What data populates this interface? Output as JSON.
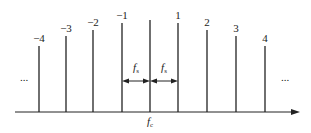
{
  "diagram": {
    "title": "",
    "baseline_y": 112,
    "axis": {
      "x_start": 15,
      "x_end": 300,
      "color": "#222222"
    },
    "center_label": {
      "main": "f",
      "sub": "c"
    },
    "spacing_label": {
      "main": "f",
      "sub": "s"
    },
    "ellipsis_left": "...",
    "ellipsis_right": "...",
    "lines": [
      {
        "index": "−4",
        "x": 39,
        "top": 46
      },
      {
        "index": "−3",
        "x": 66,
        "top": 36
      },
      {
        "index": "−2",
        "x": 93,
        "top": 30
      },
      {
        "index": "−1",
        "x": 122,
        "top": 23
      },
      {
        "index": "",
        "x": 150,
        "top": 20
      },
      {
        "index": "1",
        "x": 178,
        "top": 23
      },
      {
        "index": "2",
        "x": 207,
        "top": 30
      },
      {
        "index": "3",
        "x": 236,
        "top": 36
      },
      {
        "index": "4",
        "x": 265,
        "top": 46
      }
    ]
  }
}
